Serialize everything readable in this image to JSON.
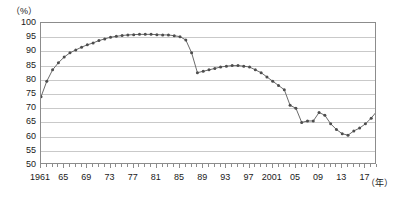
{
  "chart_data": {
    "type": "line",
    "title": "",
    "subtitle": "",
    "xlabel": "（年）",
    "ylabel": "（%）",
    "ylim": [
      50,
      100
    ],
    "ytick_step": 5,
    "yticks": [
      100,
      95,
      90,
      85,
      80,
      75,
      70,
      65,
      60,
      55,
      50
    ],
    "xlim": [
      1961,
      2019
    ],
    "xtick_step": 4,
    "xtick_labels": [
      "1961",
      "65",
      "69",
      "73",
      "77",
      "81",
      "85",
      "89",
      "93",
      "97",
      "2001",
      "05",
      "09",
      "13",
      "17"
    ],
    "xtick_years": [
      1961,
      1965,
      1969,
      1973,
      1977,
      1981,
      1985,
      1989,
      1993,
      1997,
      2001,
      2005,
      2009,
      2013,
      2017
    ],
    "grid": true,
    "legend": "none",
    "markers": true,
    "line_color": "#6b6b6b",
    "marker_color": "#4d4d4d",
    "grid_color": "#c9c9c9",
    "frame_color": "#8c8c8c",
    "x": [
      1961,
      1962,
      1963,
      1964,
      1965,
      1966,
      1967,
      1968,
      1969,
      1970,
      1971,
      1972,
      1973,
      1974,
      1975,
      1976,
      1977,
      1978,
      1979,
      1980,
      1981,
      1982,
      1983,
      1984,
      1985,
      1986,
      1987,
      1988,
      1989,
      1990,
      1991,
      1992,
      1993,
      1994,
      1995,
      1996,
      1997,
      1998,
      1999,
      2000,
      2001,
      2002,
      2003,
      2004,
      2005,
      2006,
      2007,
      2008,
      2009,
      2010,
      2011,
      2012,
      2013,
      2014,
      2015,
      2016,
      2017,
      2018,
      2019
    ],
    "values": [
      74.0,
      79.5,
      83.5,
      86.0,
      88.0,
      89.5,
      90.5,
      91.5,
      92.3,
      93.0,
      93.8,
      94.4,
      95.0,
      95.3,
      95.6,
      95.8,
      95.9,
      96.0,
      96.0,
      96.0,
      95.9,
      95.8,
      95.8,
      95.5,
      95.2,
      94.0,
      89.5,
      82.5,
      83.0,
      83.5,
      84.0,
      84.5,
      84.8,
      85.0,
      85.0,
      84.8,
      84.5,
      83.5,
      82.5,
      81.0,
      79.5,
      78.0,
      76.5,
      71.0,
      70.0,
      65.0,
      65.5,
      65.5,
      68.5,
      67.5,
      64.5,
      62.5,
      61.0,
      60.5,
      62.0,
      63.0,
      64.5,
      66.5,
      69.0
    ]
  }
}
